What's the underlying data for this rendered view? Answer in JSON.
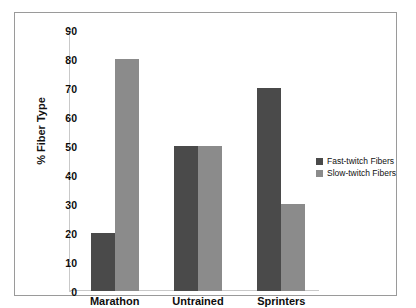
{
  "chart_data": {
    "type": "bar",
    "title": "",
    "subtitle": "",
    "xlabel": "",
    "ylabel": "% Fiber Type",
    "categories": [
      "Marathon",
      "Untrained",
      "Sprinters"
    ],
    "series": [
      {
        "name": "Fast-twitch Fibers",
        "color": "#4a4a4a",
        "values": [
          20,
          50,
          70
        ]
      },
      {
        "name": "Slow-twitch Fibers",
        "color": "#8b8b8b",
        "values": [
          80,
          50,
          30
        ]
      }
    ],
    "ylim": [
      0,
      90
    ],
    "yticks": [
      0,
      10,
      20,
      30,
      40,
      50,
      60,
      70,
      80,
      90
    ],
    "ytick_labels": [
      "0",
      "10",
      "20",
      "30",
      "40",
      "50",
      "60",
      "70",
      "80",
      "90"
    ],
    "grid": false,
    "legend_position": "right",
    "frame": true
  },
  "legend": {
    "items": [
      {
        "label": "Fast-twitch Fibers",
        "color": "#4a4a4a"
      },
      {
        "label": "Slow-twitch Fibers",
        "color": "#8b8b8b"
      }
    ]
  },
  "colors": {
    "fast_twitch": "#4a4a4a",
    "slow_twitch": "#8b8b8b",
    "frame": "#9a9a9a",
    "axis": "#c9c9c9",
    "text": "#0d0d0d",
    "background": "#ffffff"
  }
}
